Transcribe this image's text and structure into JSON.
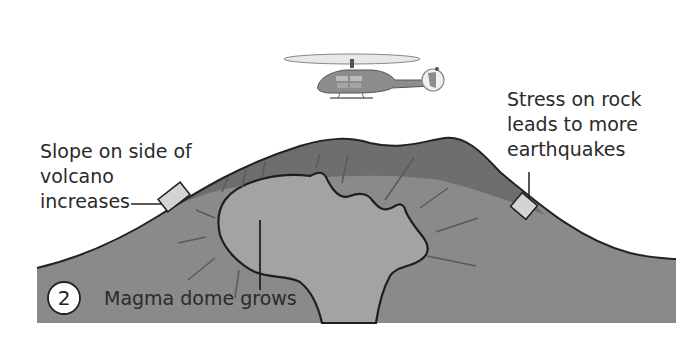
{
  "diagram": {
    "step_number": "2",
    "labels": {
      "left_line1": "Slope on side of",
      "left_line2": "volcano",
      "left_line3": "increases",
      "right_line1": "Stress on rock",
      "right_line2": "leads to more",
      "right_line3": "earthquakes",
      "bottom": "Magma dome grows"
    },
    "icons": {
      "helicopter": "helicopter-icon",
      "tiltmeter_left": "tiltmeter-icon",
      "tiltmeter_right": "tiltmeter-icon"
    },
    "colors": {
      "mountain_outer": "#7a7a7a",
      "mountain_upper": "#6a6a6a",
      "magma_dome": "#9c9c9c",
      "outline": "#222222",
      "stress_lines": "#5e5e5e",
      "instrument_fill": "#cfcfcf",
      "rotor": "#e6e6e6",
      "helicopter_body": "#8a8a8a"
    }
  }
}
